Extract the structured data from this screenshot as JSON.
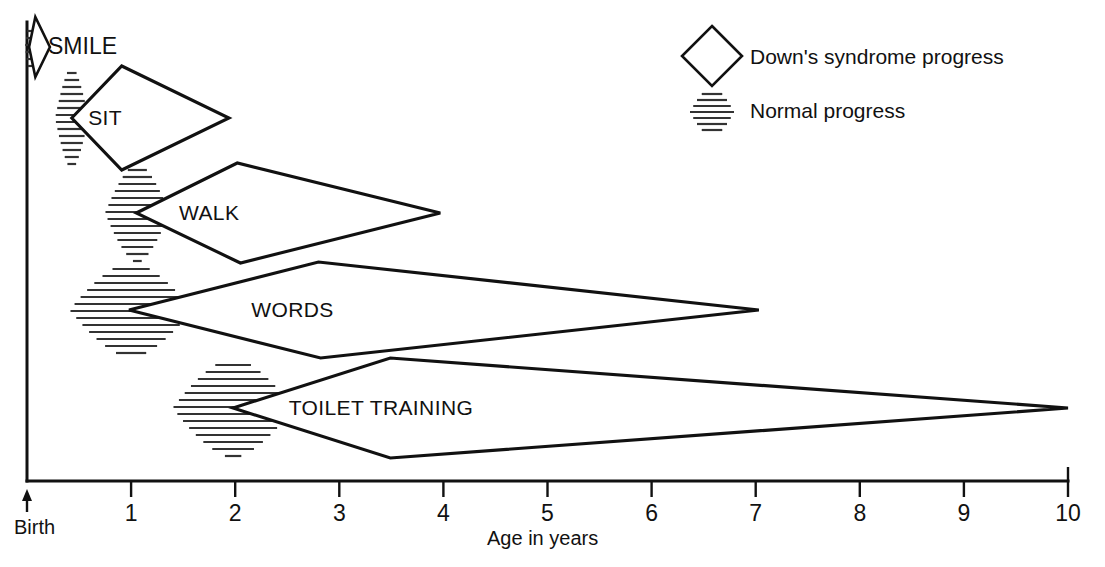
{
  "chart_data": {
    "type": "line",
    "title": "",
    "xlabel": "Age in years",
    "ylabel": "",
    "xlim": [
      0,
      10
    ],
    "x_tick_values": [
      0,
      1,
      2,
      3,
      4,
      5,
      6,
      7,
      8,
      9,
      10
    ],
    "x_tick_labels": [
      "Birth",
      "1",
      "2",
      "3",
      "4",
      "5",
      "6",
      "7",
      "8",
      "9",
      "10"
    ],
    "grid": false,
    "legend_position": "top-right",
    "origin_label": "Birth",
    "series": [
      {
        "name": "Down's syndrome progress",
        "marker": "diamond-outline",
        "milestones": [
          {
            "label": "SMILE",
            "row": 0,
            "earliest": 0.02,
            "typical_start": 0.08,
            "typical_end": 0.08,
            "latest": 0.22
          },
          {
            "label": "SIT",
            "row": 1,
            "earliest": 0.43,
            "typical_start": 0.91,
            "typical_end": 0.91,
            "latest": 1.94
          },
          {
            "label": "WALK",
            "row": 2,
            "earliest": 1.05,
            "typical_start": 2.02,
            "typical_end": 2.05,
            "latest": 3.97
          },
          {
            "label": "WORDS",
            "row": 3,
            "earliest": 0.98,
            "typical_start": 2.8,
            "typical_end": 2.82,
            "latest": 7.03
          },
          {
            "label": "TOILET TRAINING",
            "row": 4,
            "earliest": 1.98,
            "typical_start": 3.49,
            "typical_end": 3.49,
            "latest": 10.0
          }
        ]
      },
      {
        "name": "Normal progress",
        "marker": "horizontal-hatch-lens",
        "milestones": [
          {
            "label": "SMILE",
            "row": 0,
            "center": 0.04,
            "spread": 0.06
          },
          {
            "label": "SIT",
            "row": 1,
            "center": 0.43,
            "spread": 0.16
          },
          {
            "label": "WALK",
            "row": 2,
            "center": 1.06,
            "spread": 0.31
          },
          {
            "label": "WORDS",
            "row": 3,
            "center": 1.0,
            "spread": 0.59
          },
          {
            "label": "TOILET TRAINING",
            "row": 4,
            "center": 1.98,
            "spread": 0.58
          }
        ]
      }
    ],
    "annotations": [
      {
        "text": "SMILE",
        "x": 0.28,
        "row": 0
      },
      {
        "text": "SIT",
        "x": 0.75,
        "row": 1
      },
      {
        "text": "WALK",
        "x": 1.75,
        "row": 2
      },
      {
        "text": "WORDS",
        "x": 2.55,
        "row": 3
      },
      {
        "text": "TOILET TRAINING",
        "x": 3.4,
        "row": 4
      }
    ]
  },
  "legend": {
    "items": [
      {
        "label": "Down's syndrome progress",
        "icon": "diamond-outline-icon"
      },
      {
        "label": "Normal progress",
        "icon": "hatch-lens-icon"
      }
    ]
  },
  "axis": {
    "x_title": "Age in years",
    "origin_label": "Birth",
    "ticks": [
      "1",
      "2",
      "3",
      "4",
      "5",
      "6",
      "7",
      "8",
      "9",
      "10"
    ]
  },
  "colors": {
    "ink": "#111111",
    "hatch": "#333333",
    "background": "#ffffff"
  }
}
